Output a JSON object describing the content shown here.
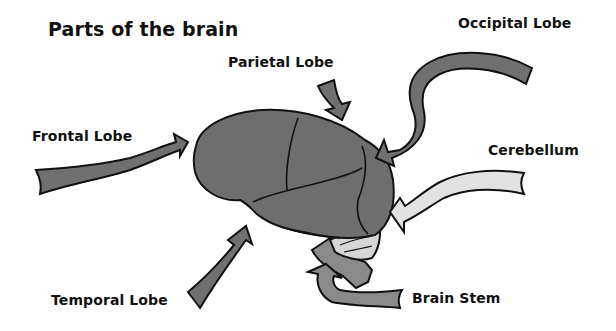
{
  "title": "Parts of the brain",
  "labels": {
    "parietal": "Parietal Lobe",
    "occipital": "Occipital Lobe",
    "frontal": "Frontal Lobe",
    "cerebellum": "Cerebellum",
    "temporal": "Temporal Lobe",
    "brain_stem": "Brain Stem"
  },
  "colors": {
    "lobe_fill": "#6e6e6e",
    "arrow_fill": "#707070",
    "arrow_light": "#e2e2e2",
    "cerebellum_fill": "#d6d6d6",
    "stem_fill": "#8a8a8a",
    "outline": "#111111",
    "background": "#ffffff"
  }
}
